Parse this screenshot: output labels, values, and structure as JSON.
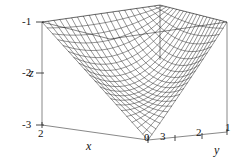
{
  "figure": {
    "kind": "3d-surface-mesh-plot",
    "background": "#ffffff",
    "line_color": "#1a1a1a",
    "box_color": "#555555"
  },
  "axes": {
    "z": {
      "label": "z",
      "ticks": [
        "-1",
        "-2",
        "-3"
      ],
      "values": [
        -1,
        -2,
        -3
      ],
      "range": [
        -3,
        -1
      ]
    },
    "x": {
      "label": "x",
      "ticks": [
        "2",
        "0"
      ],
      "values": [
        2,
        0
      ],
      "range": [
        0,
        2
      ]
    },
    "y": {
      "label": "y",
      "ticks": [
        "3",
        "2",
        "1"
      ],
      "values": [
        3,
        2,
        1
      ],
      "range": [
        1,
        3
      ]
    }
  },
  "chart_data": {
    "type": "surface",
    "title": "",
    "xlabel": "x",
    "ylabel": "y",
    "zlabel": "z",
    "xlim": [
      0,
      2
    ],
    "ylim": [
      1,
      3
    ],
    "zlim": [
      -3,
      -1
    ],
    "xticks": [
      2,
      0
    ],
    "yticks": [
      3,
      2,
      1
    ],
    "zticks": [
      -1,
      -2,
      -3
    ],
    "grid": false,
    "legend": null,
    "mesh": {
      "nx": 21,
      "ny": 21,
      "style": "wireframe"
    },
    "surface_corners": [
      {
        "x": 2,
        "y": 3,
        "z": -1.0
      },
      {
        "x": 2,
        "y": 1,
        "z": -2.6
      },
      {
        "x": 0,
        "y": 3,
        "z": -3.0
      },
      {
        "x": 0,
        "y": 1,
        "z": -1.0
      }
    ]
  }
}
